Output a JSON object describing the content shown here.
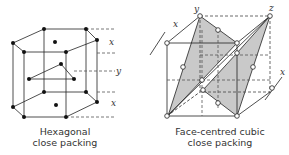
{
  "figures": [
    {
      "caption_line1": "Hexagonal",
      "caption_line2": "close packing",
      "layer_labels": [
        "x",
        "y",
        "x"
      ]
    },
    {
      "caption_line1": "Face-centred cubic",
      "caption_line2": "close packing",
      "layer_labels": [
        "x",
        "y",
        "z",
        "x"
      ]
    }
  ]
}
